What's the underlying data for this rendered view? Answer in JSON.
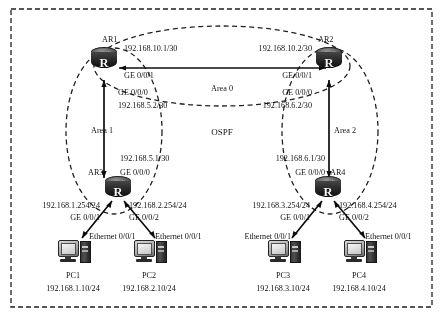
{
  "diagram": {
    "protocol_label": "OSPF",
    "areas": [
      {
        "name": "area-0",
        "label": "Area 0"
      },
      {
        "name": "area-1",
        "label": "Area 1"
      },
      {
        "name": "area-2",
        "label": "Area 2"
      }
    ],
    "routers": [
      {
        "id": "ar1",
        "label": "AR1",
        "glyph": "R"
      },
      {
        "id": "ar2",
        "label": "AR2",
        "glyph": "R"
      },
      {
        "id": "ar3",
        "label": "AR3",
        "glyph": "R"
      },
      {
        "id": "ar4",
        "label": "AR4",
        "glyph": "R"
      }
    ],
    "hosts": [
      {
        "id": "pc1",
        "label": "PC1",
        "address": "192.168.1.10/24",
        "port": "Ethernet 0/0/1"
      },
      {
        "id": "pc2",
        "label": "PC2",
        "address": "192.168.2.10/24",
        "port": "Ethernet 0/0/1"
      },
      {
        "id": "pc3",
        "label": "PC3",
        "address": "192.168.3.10/24",
        "port": "Ethernet 0/0/1"
      },
      {
        "id": "pc4",
        "label": "PC4",
        "address": "192.168.4.10/24",
        "port": "Ethernet 0/0/1"
      }
    ],
    "interfaces": {
      "ar1_ge001_addr": "192.168.10.1/30",
      "ar1_ge001_port": "GE 0/0/1",
      "ar1_ge000_port": "GE 0/0/0",
      "ar1_ge000_addr": "192.168.5.2/30",
      "ar2_ge001_addr": "192.168.10.2/30",
      "ar2_ge001_port": "GE 0/0/1",
      "ar2_ge000_port": "GE 0/0/0",
      "ar2_ge000_addr": "192.168.6.2/30",
      "ar3_ge000_addr": "192.168.5.1/30",
      "ar3_ge000_port": "GE 0/0/0",
      "ar3_ge001_addr": "192.168.1.254/24",
      "ar3_ge001_port": "GE 0/0/1",
      "ar3_ge002_addr": "192.168.2.254/24",
      "ar3_ge002_port": "GE 0/0/2",
      "ar4_ge000_addr": "192.168.6.1/30",
      "ar4_ge000_port": "GE 0/0/0",
      "ar4_ge001_addr": "192.168.3.254/24",
      "ar4_ge001_port": "GE 0/0/1",
      "ar4_ge002_addr": "192.168.4.254/24",
      "ar4_ge002_port": "GE 0/0/2"
    }
  }
}
